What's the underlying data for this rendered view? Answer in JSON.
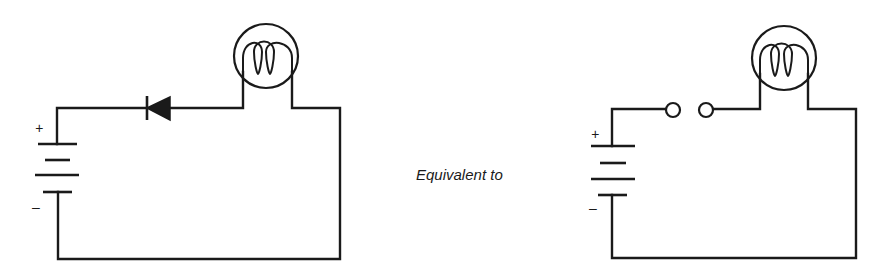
{
  "figure": {
    "caption": "Equivalent to",
    "ink_color": "#1a1a1a",
    "background": "#ffffff"
  },
  "left_circuit": {
    "name": "circuit with reverse-biased diode",
    "battery": {
      "plus_label": "+",
      "minus_label": "–",
      "cells": 2
    },
    "diode": {
      "orientation": "reverse-biased",
      "icon": "diode-icon"
    },
    "lamp": {
      "icon": "lamp-filament-icon"
    }
  },
  "right_circuit": {
    "name": "equivalent open-switch circuit",
    "battery": {
      "plus_label": "+",
      "minus_label": "–",
      "cells": 2
    },
    "switch": {
      "state": "open",
      "icon": "open-switch-icon"
    },
    "lamp": {
      "icon": "lamp-filament-icon"
    }
  }
}
